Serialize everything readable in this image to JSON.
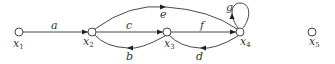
{
  "diagram": {
    "type": "signal-flow-graph",
    "nodes": [
      {
        "id": "x1",
        "label": "x",
        "sub": "1"
      },
      {
        "id": "x2",
        "label": "x",
        "sub": "2"
      },
      {
        "id": "x3",
        "label": "x",
        "sub": "3"
      },
      {
        "id": "x4",
        "label": "x",
        "sub": "4"
      },
      {
        "id": "x5",
        "label": "x",
        "sub": "5"
      }
    ],
    "edges": [
      {
        "from": "x1",
        "to": "x2",
        "label": "a"
      },
      {
        "from": "x3",
        "to": "x2",
        "label": "b"
      },
      {
        "from": "x2",
        "to": "x3",
        "label": "c"
      },
      {
        "from": "x4",
        "to": "x3",
        "label": "d"
      },
      {
        "from": "x2",
        "to": "x4",
        "label": "e"
      },
      {
        "from": "x3",
        "to": "x4",
        "label": "f"
      },
      {
        "from": "x4",
        "to": "x4",
        "label": "g"
      }
    ]
  }
}
